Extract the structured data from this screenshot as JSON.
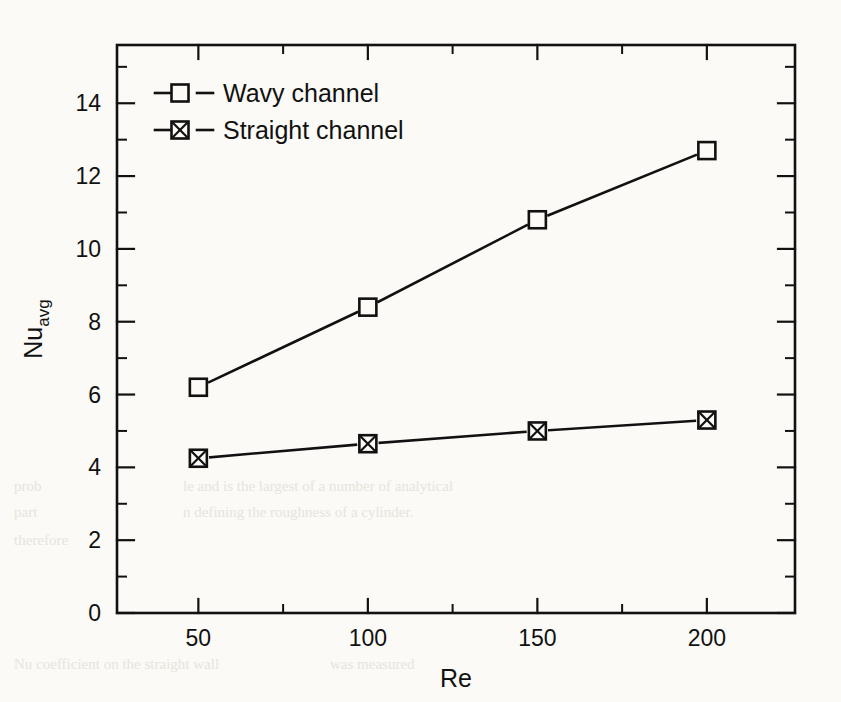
{
  "chart_data": {
    "type": "line",
    "title": "",
    "xlabel": "Re",
    "ylabel": "Nu",
    "ylabel_sub": "avg",
    "x": [
      50,
      100,
      150,
      200
    ],
    "xlim": [
      26,
      226
    ],
    "ylim": [
      0,
      15.6
    ],
    "xticks": [
      50,
      100,
      150,
      200
    ],
    "xtick_labels": [
      "50",
      "100",
      "150",
      "200"
    ],
    "x_minor_ticks": [
      75,
      125,
      175
    ],
    "yticks": [
      0,
      2,
      4,
      6,
      8,
      10,
      12,
      14
    ],
    "ytick_labels": [
      "0",
      "2",
      "4",
      "6",
      "8",
      "10",
      "12",
      "14"
    ],
    "y_minor_ticks": [
      1,
      3,
      5,
      7,
      9,
      11,
      13,
      15
    ],
    "grid": false,
    "legend_position": "upper left",
    "series": [
      {
        "name": "Wavy channel",
        "marker": "open-square",
        "values": [
          6.2,
          8.4,
          10.8,
          12.7
        ]
      },
      {
        "name": "Straight channel",
        "marker": "crossed-square",
        "values": [
          4.25,
          4.65,
          5.0,
          5.3
        ]
      }
    ]
  },
  "legend": {
    "items": [
      {
        "label": "Wavy channel",
        "marker": "open-square"
      },
      {
        "label": "Straight channel",
        "marker": "crossed-square"
      }
    ]
  },
  "colors": {
    "ink": "#111111",
    "paper": "#fbfaf6"
  },
  "scan_artifacts": [
    {
      "text": "prob",
      "x": 14,
      "y": 486
    },
    {
      "text": "part",
      "x": 14,
      "y": 512
    },
    {
      "text": "le and is the largest of a number of analytical",
      "x": 183,
      "y": 486
    },
    {
      "text": "n defining the roughness of a cylinder.",
      "x": 183,
      "y": 512
    },
    {
      "text": "therefore",
      "x": 14,
      "y": 540
    },
    {
      "text": "Nu coefficient on the straight wall",
      "x": 14,
      "y": 664
    },
    {
      "text": "was measured",
      "x": 330,
      "y": 664
    }
  ]
}
